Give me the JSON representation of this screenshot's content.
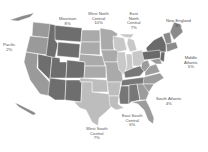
{
  "map": {
    "type": "choropleth",
    "subject": "US Census Divisions",
    "colors": {
      "background": "#ffffff",
      "state_border": "#ffffff",
      "label_text": "#555555",
      "pacific": "#9a9a9a",
      "mountain": "#6e6e6e",
      "west_north_central": "#aaaaaa",
      "east_north_central": "#c8c8c8",
      "west_south_central": "#bdbdbd",
      "east_south_central": "#777777",
      "south_atlantic": "#9c9c9c",
      "middle_atlantic": "#6a6a6a",
      "new_england": "#8a8a8a"
    },
    "regions": [
      {
        "id": "pacific",
        "name": "Pacific",
        "value": "2%"
      },
      {
        "id": "mountain",
        "name": "Mountain",
        "value": "8%"
      },
      {
        "id": "west_north_central",
        "name_line1": "West North",
        "name_line2": "Central",
        "value": "10%"
      },
      {
        "id": "east_north_central",
        "name_line1": "East",
        "name_line2": "North",
        "name_line3": "Central",
        "value": "7%"
      },
      {
        "id": "new_england",
        "name": "New England",
        "value": "8%"
      },
      {
        "id": "middle_atlantic",
        "name_line1": "Middle",
        "name_line2": "Atlantic",
        "value": "5%"
      },
      {
        "id": "south_atlantic",
        "name": "South Atlantic",
        "value": "4%"
      },
      {
        "id": "east_south_central",
        "name_line1": "East South",
        "name_line2": "Central",
        "value": "6%"
      },
      {
        "id": "west_south_central",
        "name_line1": "West South",
        "name_line2": "Central",
        "value": "7%"
      }
    ]
  }
}
